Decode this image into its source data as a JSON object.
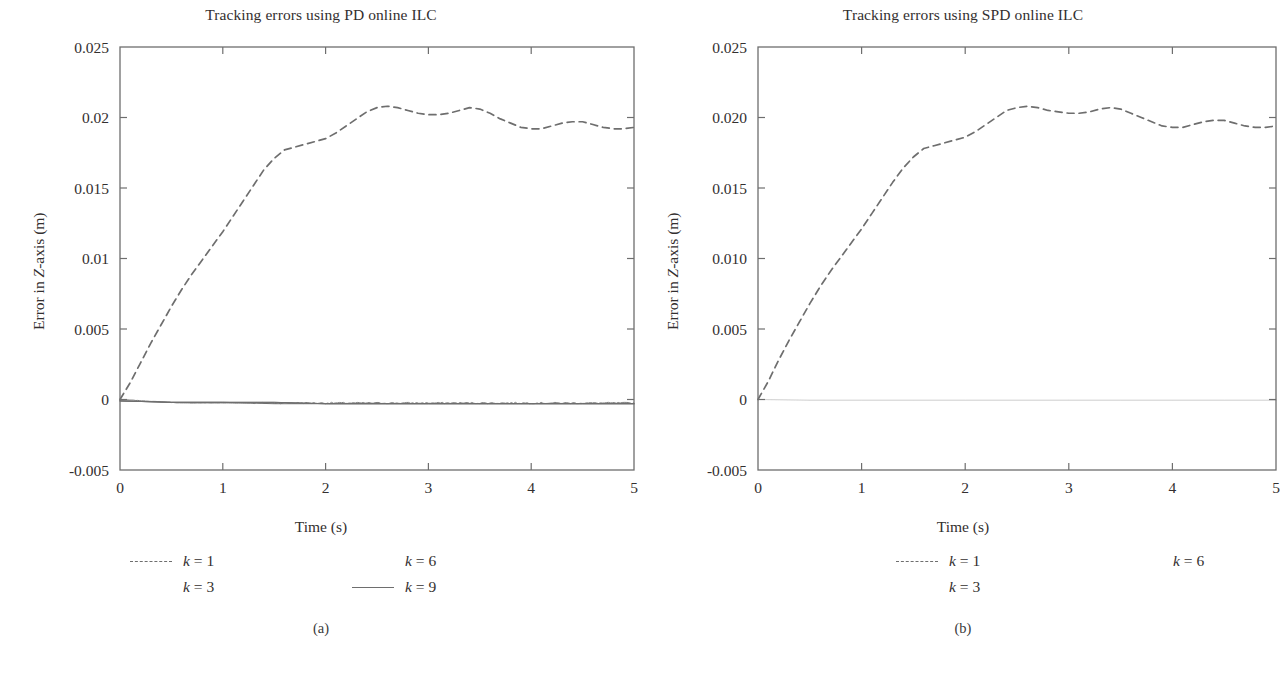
{
  "figure": {
    "panels": [
      {
        "id": "a",
        "subcaption": "(a)",
        "title": "Tracking errors using PD online ILC",
        "xlabel": "Time (s)",
        "ylabel_pre": "Error in ",
        "ylabel_italic": "Z",
        "ylabel_post": "-axis (m)",
        "yticklabels": [
          "0.025",
          "0.02",
          "0.015",
          "0.01",
          "0.005",
          "0",
          "-0.005"
        ],
        "xticklabels": [
          "0",
          "1",
          "2",
          "3",
          "4",
          "5"
        ],
        "legend": [
          {
            "label_k": "k",
            "label_eq": " = ",
            "label_v": "1",
            "style": "dashed",
            "col": 0,
            "row": 0
          },
          {
            "label_k": "k",
            "label_eq": " = ",
            "label_v": "3",
            "style": "none",
            "col": 0,
            "row": 1
          },
          {
            "label_k": "k",
            "label_eq": " = ",
            "label_v": "6",
            "style": "none",
            "col": 1,
            "row": 0
          },
          {
            "label_k": "k",
            "label_eq": " = ",
            "label_v": "9",
            "style": "solid",
            "col": 1,
            "row": 1
          }
        ]
      },
      {
        "id": "b",
        "subcaption": "(b)",
        "title": "Tracking errors using SPD online ILC",
        "xlabel": "Time (s)",
        "ylabel_pre": "Error in ",
        "ylabel_italic": "Z",
        "ylabel_post": "-axis (m)",
        "yticklabels": [
          "0.025",
          "0.020",
          "0.015",
          "0.010",
          "0.005",
          "0",
          "-0.005"
        ],
        "xticklabels": [
          "0",
          "1",
          "2",
          "3",
          "4",
          "5"
        ],
        "legend": [
          {
            "label_k": "k",
            "label_eq": " = ",
            "label_v": "1",
            "style": "dashed",
            "col": 0,
            "row": 0
          },
          {
            "label_k": "k",
            "label_eq": " = ",
            "label_v": "3",
            "style": "none",
            "col": 0,
            "row": 1
          },
          {
            "label_k": "k",
            "label_eq": " = ",
            "label_v": "6",
            "style": "none",
            "col": 1,
            "row": 0
          }
        ]
      }
    ]
  },
  "chart_data": [
    {
      "type": "line",
      "panel": "a",
      "title": "Tracking errors using PD online ILC",
      "xlabel": "Time (s)",
      "ylabel": "Error in Z-axis (m)",
      "xlim": [
        0,
        5
      ],
      "ylim": [
        -0.005,
        0.025
      ],
      "xticks": [
        0,
        1,
        2,
        3,
        4,
        5
      ],
      "yticks": [
        -0.005,
        0,
        0.005,
        0.01,
        0.015,
        0.02,
        0.025
      ],
      "grid": false,
      "legend_position": "below-plot",
      "line_color": "#6e6e6e",
      "series": [
        {
          "name": "k = 1",
          "style": "dashed",
          "x": [
            0,
            0.1,
            0.2,
            0.3,
            0.4,
            0.5,
            0.6,
            0.7,
            0.8,
            0.9,
            1.0,
            1.1,
            1.2,
            1.3,
            1.4,
            1.5,
            1.6,
            1.7,
            1.8,
            1.9,
            2.0,
            2.1,
            2.2,
            2.3,
            2.4,
            2.5,
            2.6,
            2.7,
            2.8,
            2.9,
            3.0,
            3.1,
            3.2,
            3.3,
            3.4,
            3.5,
            3.6,
            3.7,
            3.8,
            3.9,
            4.0,
            4.1,
            4.2,
            4.3,
            4.4,
            4.5,
            4.6,
            4.7,
            4.8,
            4.9,
            5.0
          ],
          "y": [
            0.0,
            0.0012,
            0.0026,
            0.004,
            0.0053,
            0.0066,
            0.0078,
            0.0089,
            0.0099,
            0.0109,
            0.0119,
            0.013,
            0.0141,
            0.0152,
            0.0163,
            0.0171,
            0.0177,
            0.0179,
            0.0181,
            0.0183,
            0.0185,
            0.0189,
            0.0194,
            0.0199,
            0.0204,
            0.0207,
            0.0208,
            0.0207,
            0.0205,
            0.0203,
            0.0202,
            0.0202,
            0.0203,
            0.0205,
            0.0207,
            0.0206,
            0.0203,
            0.0199,
            0.0196,
            0.0193,
            0.0192,
            0.0192,
            0.0194,
            0.0196,
            0.0197,
            0.0197,
            0.0195,
            0.0193,
            0.0192,
            0.0192,
            0.0193
          ]
        },
        {
          "name": "k = 3",
          "style": "solid",
          "x": [
            0,
            0.5,
            1.0,
            1.5,
            2.0,
            2.5,
            3.0,
            3.5,
            4.0,
            4.5,
            5.0
          ],
          "y": [
            -0.0001,
            -0.0002,
            -0.0002,
            -0.0003,
            -0.0003,
            -0.0003,
            -0.0003,
            -0.0003,
            -0.0003,
            -0.0003,
            -0.0003
          ]
        },
        {
          "name": "k = 6",
          "style": "solid",
          "x": [
            0,
            0.5,
            1.0,
            1.5,
            2.0,
            2.5,
            3.0,
            3.5,
            4.0,
            4.5,
            5.0
          ],
          "y": [
            -0.0001,
            -0.0002,
            -0.0002,
            -0.0002,
            -0.0003,
            -0.0003,
            -0.0003,
            -0.0003,
            -0.0003,
            -0.0003,
            -0.0003
          ]
        },
        {
          "name": "k = 9",
          "style": "solid",
          "x": [
            0,
            0.5,
            1.0,
            1.5,
            2.0,
            2.5,
            3.0,
            3.5,
            4.0,
            4.5,
            5.0
          ],
          "y": [
            -0.0001,
            -0.0002,
            -0.0002,
            -0.0002,
            -0.0003,
            -0.0003,
            -0.0003,
            -0.0003,
            -0.0003,
            -0.0003,
            -0.0003
          ]
        }
      ]
    },
    {
      "type": "line",
      "panel": "b",
      "title": "Tracking errors using SPD online ILC",
      "xlabel": "Time (s)",
      "ylabel": "Error in Z-axis (m)",
      "xlim": [
        0,
        5
      ],
      "ylim": [
        -0.005,
        0.025
      ],
      "xticks": [
        0,
        1,
        2,
        3,
        4,
        5
      ],
      "yticks": [
        -0.005,
        0,
        0.005,
        0.01,
        0.015,
        0.02,
        0.025
      ],
      "grid": false,
      "legend_position": "below-plot",
      "line_color": "#6e6e6e",
      "series": [
        {
          "name": "k = 1",
          "style": "dashed",
          "x": [
            0,
            0.1,
            0.2,
            0.3,
            0.4,
            0.5,
            0.6,
            0.7,
            0.8,
            0.9,
            1.0,
            1.1,
            1.2,
            1.3,
            1.4,
            1.5,
            1.6,
            1.7,
            1.8,
            1.9,
            2.0,
            2.1,
            2.2,
            2.3,
            2.4,
            2.5,
            2.6,
            2.7,
            2.8,
            2.9,
            3.0,
            3.1,
            3.2,
            3.3,
            3.4,
            3.5,
            3.6,
            3.7,
            3.8,
            3.9,
            4.0,
            4.1,
            4.2,
            4.3,
            4.4,
            4.5,
            4.6,
            4.7,
            4.8,
            4.9,
            5.0
          ],
          "y": [
            0.0,
            0.0013,
            0.0028,
            0.0042,
            0.0055,
            0.0068,
            0.008,
            0.0091,
            0.0101,
            0.0111,
            0.0121,
            0.0132,
            0.0143,
            0.0154,
            0.0164,
            0.0172,
            0.0178,
            0.018,
            0.0182,
            0.0184,
            0.0186,
            0.019,
            0.0195,
            0.02,
            0.0205,
            0.0207,
            0.0208,
            0.0207,
            0.0205,
            0.0204,
            0.0203,
            0.0203,
            0.0204,
            0.0206,
            0.0207,
            0.0206,
            0.0203,
            0.02,
            0.0197,
            0.0194,
            0.0193,
            0.0193,
            0.0195,
            0.0197,
            0.0198,
            0.0198,
            0.0196,
            0.0194,
            0.0193,
            0.0193,
            0.0194
          ]
        },
        {
          "name": "k = 3",
          "style": "solid",
          "x": [
            0,
            0.5,
            1.0,
            1.5,
            2.0,
            2.5,
            3.0,
            3.5,
            4.0,
            4.5,
            5.0
          ],
          "y": [
            0.0,
            -5e-05,
            -5e-05,
            -5e-05,
            -5e-05,
            -5e-05,
            -5e-05,
            -5e-05,
            -5e-05,
            -5e-05,
            -5e-05
          ]
        },
        {
          "name": "k = 6",
          "style": "solid",
          "x": [
            0,
            0.5,
            1.0,
            1.5,
            2.0,
            2.5,
            3.0,
            3.5,
            4.0,
            4.5,
            5.0
          ],
          "y": [
            0.0,
            -5e-05,
            -5e-05,
            -5e-05,
            -5e-05,
            -5e-05,
            -5e-05,
            -5e-05,
            -5e-05,
            -5e-05,
            -5e-05
          ]
        }
      ]
    }
  ]
}
